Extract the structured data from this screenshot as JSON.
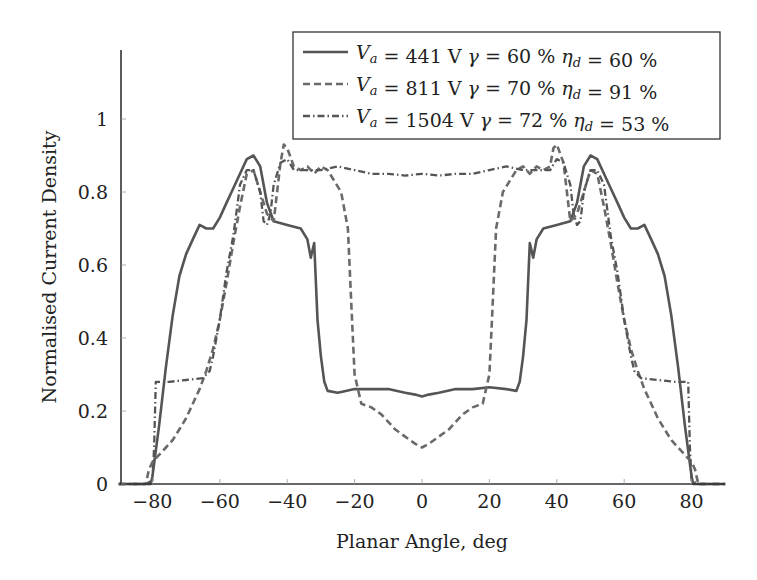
{
  "chart_data": {
    "type": "line",
    "title": "",
    "xlabel": "Planar Angle, deg",
    "ylabel": "Normalised Current Density",
    "xlim": [
      -90,
      90
    ],
    "ylim": [
      0,
      1.19
    ],
    "xticks": [
      -80,
      -60,
      -40,
      -20,
      0,
      20,
      40,
      60,
      80
    ],
    "xtick_labels": [
      "−80",
      "−60",
      "−40",
      "−20",
      "0",
      "20",
      "40",
      "60",
      "80"
    ],
    "yticks": [
      0,
      0.2,
      0.4,
      0.6,
      0.8,
      1
    ],
    "ytick_labels": [
      "0",
      "0.2",
      "0.4",
      "0.6",
      "0.8",
      "1"
    ],
    "grid": false,
    "legend_position": "upper right",
    "series": [
      {
        "name": "Va = 441 V γ = 60 % ηd = 60 %",
        "legend": {
          "v": "441",
          "gamma": "60",
          "eta": "60"
        },
        "style": "solid",
        "color": "#555555",
        "x": [
          -90,
          -80.5,
          -80,
          -78,
          -76,
          -74,
          -72,
          -70,
          -68,
          -66,
          -64,
          -62,
          -60,
          -58,
          -56,
          -54,
          -52,
          -50,
          -48,
          -46,
          -44,
          -40,
          -36,
          -34,
          -33,
          -32,
          -31,
          -30,
          -29,
          -28,
          -25,
          -20,
          -15,
          -10,
          -5,
          -2,
          0,
          2,
          5,
          10,
          15,
          20,
          25,
          28,
          29,
          30,
          31,
          32,
          33,
          34,
          36,
          40,
          44,
          46,
          48,
          50,
          52,
          54,
          56,
          58,
          60,
          62,
          64,
          66,
          68,
          70,
          72,
          74,
          76,
          78,
          80,
          80.5,
          90
        ],
        "y": [
          0,
          0,
          0.02,
          0.16,
          0.32,
          0.46,
          0.57,
          0.63,
          0.67,
          0.71,
          0.7,
          0.7,
          0.73,
          0.77,
          0.81,
          0.85,
          0.89,
          0.9,
          0.87,
          0.77,
          0.72,
          0.71,
          0.7,
          0.67,
          0.62,
          0.66,
          0.45,
          0.35,
          0.28,
          0.255,
          0.25,
          0.26,
          0.26,
          0.26,
          0.25,
          0.245,
          0.24,
          0.245,
          0.25,
          0.26,
          0.26,
          0.265,
          0.26,
          0.255,
          0.28,
          0.35,
          0.45,
          0.66,
          0.62,
          0.67,
          0.7,
          0.71,
          0.72,
          0.77,
          0.87,
          0.9,
          0.89,
          0.85,
          0.81,
          0.77,
          0.73,
          0.7,
          0.7,
          0.71,
          0.67,
          0.63,
          0.57,
          0.46,
          0.32,
          0.16,
          0.02,
          0,
          0
        ]
      },
      {
        "name": "Va = 811 V γ = 70 % ηd = 91 %",
        "legend": {
          "v": "811",
          "gamma": "70",
          "eta": "91"
        },
        "style": "dashed",
        "color": "#6a6a6a",
        "x": [
          -90,
          -82,
          -81,
          -80,
          -78,
          -76,
          -74,
          -72,
          -70,
          -68,
          -66,
          -64,
          -62,
          -60,
          -58,
          -56,
          -54,
          -52,
          -50,
          -48,
          -46,
          -44,
          -42,
          -41,
          -40,
          -38,
          -36,
          -34,
          -32,
          -30,
          -28,
          -26,
          -24,
          -22,
          -21,
          -20,
          -18,
          -15,
          -12,
          -10,
          -8,
          -5,
          -2,
          0,
          2,
          5,
          8,
          10,
          12,
          15,
          18,
          20,
          21,
          22,
          24,
          26,
          28,
          30,
          32,
          34,
          36,
          38,
          39,
          40,
          42,
          44,
          46,
          48,
          50,
          52,
          54,
          56,
          58,
          60,
          62,
          64,
          66,
          68,
          70,
          72,
          74,
          76,
          78,
          80,
          81,
          82,
          90
        ],
        "y": [
          0,
          0,
          0.04,
          0.06,
          0.08,
          0.1,
          0.12,
          0.15,
          0.18,
          0.22,
          0.26,
          0.31,
          0.37,
          0.45,
          0.55,
          0.66,
          0.76,
          0.85,
          0.86,
          0.8,
          0.74,
          0.72,
          0.88,
          0.93,
          0.92,
          0.87,
          0.86,
          0.87,
          0.85,
          0.87,
          0.86,
          0.83,
          0.8,
          0.7,
          0.5,
          0.3,
          0.22,
          0.21,
          0.19,
          0.17,
          0.15,
          0.13,
          0.11,
          0.1,
          0.11,
          0.13,
          0.15,
          0.17,
          0.19,
          0.21,
          0.22,
          0.3,
          0.5,
          0.7,
          0.8,
          0.83,
          0.86,
          0.87,
          0.85,
          0.87,
          0.86,
          0.87,
          0.92,
          0.93,
          0.88,
          0.72,
          0.74,
          0.8,
          0.86,
          0.85,
          0.76,
          0.66,
          0.55,
          0.45,
          0.37,
          0.31,
          0.26,
          0.22,
          0.18,
          0.15,
          0.12,
          0.1,
          0.08,
          0.06,
          0.04,
          0,
          0
        ]
      },
      {
        "name": "Va = 1504 V γ = 72 % ηd = 53 %",
        "legend": {
          "v": "1504",
          "gamma": "72",
          "eta": "53"
        },
        "style": "dashdot",
        "color": "#555555",
        "x": [
          -90,
          -82,
          -80,
          -79.5,
          -79,
          -75,
          -70,
          -65,
          -63,
          -62,
          -60,
          -58,
          -56,
          -55,
          -54,
          -52,
          -50,
          -48,
          -47,
          -46,
          -45,
          -44,
          -42,
          -40,
          -38,
          -35,
          -30,
          -25,
          -20,
          -15,
          -10,
          -5,
          0,
          5,
          10,
          15,
          20,
          25,
          30,
          35,
          38,
          40,
          42,
          44,
          45,
          46,
          47,
          48,
          50,
          52,
          54,
          55,
          56,
          58,
          60,
          62,
          63,
          65,
          70,
          75,
          79,
          79.5,
          80,
          82,
          90
        ],
        "y": [
          0,
          0,
          0.01,
          0.1,
          0.28,
          0.28,
          0.285,
          0.29,
          0.31,
          0.35,
          0.45,
          0.58,
          0.68,
          0.75,
          0.82,
          0.86,
          0.86,
          0.8,
          0.72,
          0.71,
          0.74,
          0.82,
          0.88,
          0.89,
          0.86,
          0.86,
          0.86,
          0.87,
          0.86,
          0.85,
          0.85,
          0.845,
          0.85,
          0.845,
          0.85,
          0.85,
          0.86,
          0.87,
          0.86,
          0.86,
          0.86,
          0.89,
          0.88,
          0.82,
          0.74,
          0.71,
          0.72,
          0.8,
          0.86,
          0.86,
          0.82,
          0.75,
          0.68,
          0.58,
          0.45,
          0.35,
          0.31,
          0.29,
          0.285,
          0.28,
          0.28,
          0.1,
          0.01,
          0,
          0
        ]
      }
    ]
  }
}
